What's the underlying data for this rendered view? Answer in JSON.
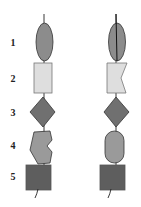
{
  "labels": [
    "1",
    "2",
    "3",
    "4",
    "5"
  ],
  "columns": [
    {
      "name": "left",
      "shapes": [
        {
          "row": "1",
          "shape": "ellipse",
          "fill": "#8c8c8c"
        },
        {
          "row": "2",
          "shape": "rectangle",
          "fill": "#dedede"
        },
        {
          "row": "3",
          "shape": "diamond",
          "fill": "#707070"
        },
        {
          "row": "4",
          "shape": "notched-polygon",
          "fill": "#9a9a9a"
        },
        {
          "row": "5",
          "shape": "square",
          "fill": "#5e5e5e"
        }
      ]
    },
    {
      "name": "right",
      "shapes": [
        {
          "row": "1",
          "shape": "ellipse-with-line",
          "fill": "#8c8c8c"
        },
        {
          "row": "2",
          "shape": "notched-rectangle",
          "fill": "#dedede"
        },
        {
          "row": "3",
          "shape": "diamond",
          "fill": "#707070"
        },
        {
          "row": "4",
          "shape": "rounded-pill",
          "fill": "#9a9a9a"
        },
        {
          "row": "5",
          "shape": "square",
          "fill": "#5e5e5e"
        }
      ]
    }
  ],
  "colors": {
    "stroke": "#333333",
    "ellipse": "#8c8c8c",
    "rect": "#dedede",
    "diamond": "#707070",
    "row4": "#9a9a9a",
    "square": "#5e5e5e"
  }
}
